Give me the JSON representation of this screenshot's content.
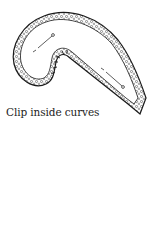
{
  "caption": "Clip inside curves",
  "illustration": {
    "subject": "curved fabric piece with seam allowance",
    "colors": {
      "outline": "#1a1a1a",
      "fill": "#ffffff",
      "texture": "#555555"
    }
  }
}
